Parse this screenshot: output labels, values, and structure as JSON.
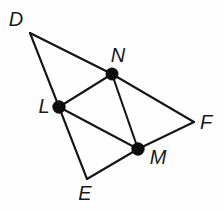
{
  "figure": {
    "background_color": "#fefefe",
    "stroke_color": "#161616",
    "dot_color": "#0d0d0d",
    "label_color": "#1a1a1a",
    "width": 224,
    "height": 211
  },
  "points": [
    {
      "id": "D",
      "label": "D",
      "x": 30,
      "y": 33,
      "label_x": 16,
      "label_y": 21,
      "dot": false,
      "dot_r": 0
    },
    {
      "id": "N",
      "label": "N",
      "x": 112,
      "y": 74,
      "label_x": 118,
      "label_y": 57,
      "dot": true,
      "dot_r": 6.2
    },
    {
      "id": "L",
      "label": "L",
      "x": 59,
      "y": 107,
      "label_x": 44,
      "label_y": 108,
      "dot": true,
      "dot_r": 6.4
    },
    {
      "id": "M",
      "label": "M",
      "x": 138,
      "y": 149,
      "label_x": 158,
      "label_y": 159,
      "dot": true,
      "dot_r": 6.4
    },
    {
      "id": "F",
      "label": "F",
      "x": 194,
      "y": 122,
      "label_x": 206,
      "label_y": 124,
      "dot": false,
      "dot_r": 0
    },
    {
      "id": "E",
      "label": "E",
      "x": 87,
      "y": 179,
      "label_x": 85,
      "label_y": 195,
      "dot": false,
      "dot_r": 0
    }
  ],
  "edges": [
    {
      "id": "DN",
      "from": "D",
      "to": "N",
      "kind": "outer-side"
    },
    {
      "id": "NF",
      "from": "N",
      "to": "F",
      "kind": "outer-side"
    },
    {
      "id": "DL",
      "from": "D",
      "to": "L",
      "kind": "outer-side"
    },
    {
      "id": "LE",
      "from": "L",
      "to": "E",
      "kind": "outer-side"
    },
    {
      "id": "EM",
      "from": "E",
      "to": "M",
      "kind": "outer-side"
    },
    {
      "id": "MF",
      "from": "M",
      "to": "F",
      "kind": "outer-side"
    },
    {
      "id": "LN",
      "from": "L",
      "to": "N",
      "kind": "midsegment"
    },
    {
      "id": "LM",
      "from": "L",
      "to": "M",
      "kind": "midsegment"
    },
    {
      "id": "NM",
      "from": "N",
      "to": "M",
      "kind": "midsegment"
    }
  ]
}
